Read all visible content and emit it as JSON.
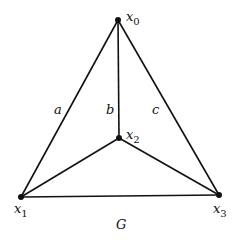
{
  "diagram": {
    "title": "G",
    "vertices": [
      {
        "id": "x0",
        "label": "x",
        "sub": "0",
        "x": 118,
        "y": 20
      },
      {
        "id": "x1",
        "label": "x",
        "sub": "1",
        "x": 21,
        "y": 197
      },
      {
        "id": "x2",
        "label": "x",
        "sub": "2",
        "x": 119,
        "y": 138
      },
      {
        "id": "x3",
        "label": "x",
        "sub": "3",
        "x": 219,
        "y": 195
      }
    ],
    "edges": [
      {
        "from": "x0",
        "to": "x1",
        "label": "a"
      },
      {
        "from": "x0",
        "to": "x2",
        "label": "b"
      },
      {
        "from": "x0",
        "to": "x3",
        "label": "c"
      },
      {
        "from": "x1",
        "to": "x2",
        "label": ""
      },
      {
        "from": "x2",
        "to": "x3",
        "label": ""
      },
      {
        "from": "x1",
        "to": "x3",
        "label": ""
      }
    ],
    "edge_labels": {
      "a": "a",
      "b": "b",
      "c": "c"
    },
    "vertex_labels": {
      "x0": {
        "main": "x",
        "sub": "0"
      },
      "x1": {
        "main": "x",
        "sub": "1"
      },
      "x2": {
        "main": "x",
        "sub": "2"
      },
      "x3": {
        "main": "x",
        "sub": "3"
      }
    },
    "caption": "G",
    "colors": {
      "stroke": "#111111",
      "background": "#ffffff"
    }
  }
}
